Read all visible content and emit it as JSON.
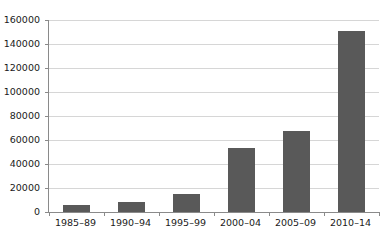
{
  "chart_data": {
    "type": "bar",
    "title": "",
    "subtitle": "",
    "xlabel": "",
    "ylabel": "",
    "categories": [
      "1985–89",
      "1990–94",
      "1995–99",
      "2000–04",
      "2005–09",
      "2010–14"
    ],
    "values": [
      6000,
      8500,
      15000,
      53000,
      67500,
      151000
    ],
    "ylim": [
      0,
      160000
    ],
    "yticks": [
      0,
      20000,
      40000,
      60000,
      80000,
      100000,
      120000,
      140000,
      160000
    ],
    "ytick_labels": [
      "0",
      "20000",
      "40000",
      "60000",
      "80000",
      "100000",
      "120000",
      "140000",
      "160000"
    ],
    "grid": true,
    "legend": false,
    "legend_position": "none",
    "series": [
      {
        "name": "",
        "values": [
          6000,
          8500,
          15000,
          53000,
          67500,
          151000
        ]
      }
    ],
    "colors": {
      "bar_fill": "#595959",
      "gridline": "#d6d6d6",
      "axis": "#8a8a8a",
      "background": "#ffffff",
      "text": "#1a1a1a"
    }
  }
}
